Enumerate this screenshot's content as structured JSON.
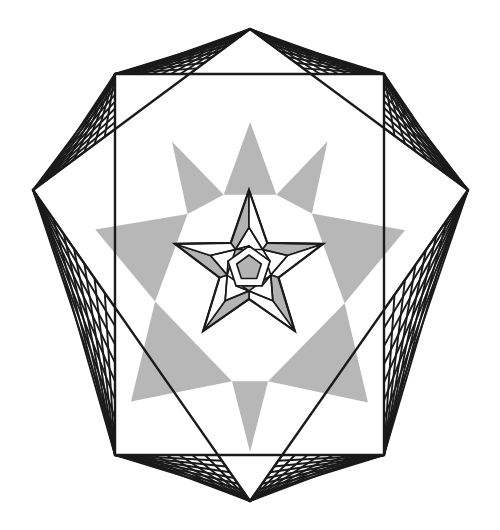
{
  "artwork": {
    "title": "Eight-pointed star string-art geometric figure",
    "canvas": {
      "width": 500,
      "height": 530,
      "background": "#ffffff"
    },
    "colors": {
      "stroke": "#1a1a1a",
      "shade_gray": "#b3b3b3",
      "shade_gray_light": "#c4c4c4",
      "background": "#ffffff",
      "white_fill": "#ffffff"
    },
    "stroke_widths": {
      "octagram_outline": 2.4,
      "web_thread": 1.9,
      "inner_star_outline": 2.2,
      "inner_facet": 1.6
    },
    "octagram": {
      "type": "two-overlapping-squares",
      "center": {
        "x": 250,
        "y": 287
      },
      "outer_radius": 218,
      "point_count": 8,
      "tip_angles_deg": [
        270,
        315,
        0,
        45,
        90,
        135,
        180,
        225
      ],
      "tips": [
        {
          "name": "top",
          "x": 250,
          "y": 29
        },
        {
          "name": "upper-right",
          "x": 384,
          "y": 74
        },
        {
          "name": "right",
          "x": 468,
          "y": 190
        },
        {
          "name": "lower-right",
          "x": 384,
          "y": 455
        },
        {
          "name": "bottom",
          "x": 250,
          "y": 501
        },
        {
          "name": "lower-left",
          "x": 115,
          "y": 455
        },
        {
          "name": "left",
          "x": 33,
          "y": 190
        },
        {
          "name": "upper-left",
          "x": 115,
          "y": 74
        }
      ],
      "square_a_vertices": [
        "top",
        "right",
        "bottom",
        "left"
      ],
      "square_b_vertices": [
        "upper-left",
        "upper-right",
        "lower-right",
        "lower-left"
      ],
      "inner_radius": 96
    },
    "webs": {
      "description": "string-art threads spanning each concave valley of the octagram",
      "valley_count": 8,
      "threads_per_side": 7,
      "thread_color": "#1a1a1a"
    },
    "shading": {
      "description": "light gray triangular facets where octagram arms overlap near the centre",
      "region_count": 8,
      "fill": "#b3b3b3"
    },
    "inner_star": {
      "type": "five-pointed-star",
      "center": {
        "x": 249,
        "y": 268
      },
      "outer_radius": 78,
      "inner_radius": 31,
      "rotation_deg": -90,
      "pentagon_radius": 22,
      "pentagon_inner_radius": 13,
      "facet_count": 5,
      "shaded_facets": true
    }
  },
  "labels": {
    "figure_caption": ""
  }
}
